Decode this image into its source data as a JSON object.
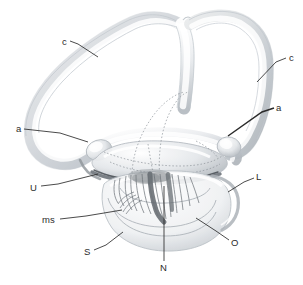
{
  "figure": {
    "background_color": "#ffffff",
    "ink_color": "#2b2b2b",
    "structure_color": "#c9cdd2",
    "shadow_color": "#9aa0a6",
    "dark_accent_color": "#555b60",
    "width": 303,
    "height": 285
  },
  "labels": [
    {
      "id": "c-left",
      "text": "c",
      "x": 62,
      "y": 42,
      "anchor": "start"
    },
    {
      "id": "c-right",
      "text": "c",
      "x": 289,
      "y": 58,
      "anchor": "start"
    },
    {
      "id": "a-left",
      "text": "a",
      "x": 16,
      "y": 129,
      "anchor": "start"
    },
    {
      "id": "a-right",
      "text": "a",
      "x": 276,
      "y": 108,
      "anchor": "start"
    },
    {
      "id": "u",
      "text": "U",
      "x": 30,
      "y": 188,
      "anchor": "start"
    },
    {
      "id": "ms",
      "text": "ms",
      "x": 42,
      "y": 220,
      "anchor": "start"
    },
    {
      "id": "s",
      "text": "S",
      "x": 84,
      "y": 252,
      "anchor": "start"
    },
    {
      "id": "n",
      "text": "N",
      "x": 160,
      "y": 268,
      "anchor": "start"
    },
    {
      "id": "o",
      "text": "O",
      "x": 231,
      "y": 243,
      "anchor": "start"
    },
    {
      "id": "l",
      "text": "L",
      "x": 256,
      "y": 177,
      "anchor": "start"
    }
  ],
  "leader_lines": [
    {
      "id": "leader-c-left",
      "points": "70,41 78,44 98,57"
    },
    {
      "id": "leader-c-right",
      "points": "286,58 276,62 257,82"
    },
    {
      "id": "leader-a-left",
      "points": "24,129 60,133 88,142"
    },
    {
      "id": "leader-a-right",
      "points": "274,108 262,112 228,136"
    },
    {
      "id": "leader-u",
      "points": "41,186 58,184 98,174"
    },
    {
      "id": "leader-ms",
      "points": "60,219 86,216 122,210"
    },
    {
      "id": "leader-s",
      "points": "94,250 106,245 123,232"
    },
    {
      "id": "leader-n",
      "points": "164,261 164,222 164,186"
    },
    {
      "id": "leader-o",
      "points": "229,240 216,231 196,218"
    },
    {
      "id": "leader-l",
      "points": "254,178 244,182 228,192"
    }
  ]
}
